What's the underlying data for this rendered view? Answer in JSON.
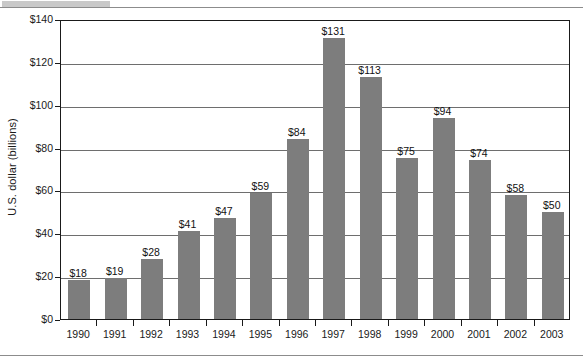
{
  "chart_data": {
    "type": "bar",
    "title": "",
    "subtitle": "",
    "xlabel": "",
    "ylabel": "U.S. dollar (billions)",
    "categories": [
      "1990",
      "1991",
      "1992",
      "1993",
      "1994",
      "1995",
      "1996",
      "1997",
      "1998",
      "1999",
      "2000",
      "2001",
      "2002",
      "2003"
    ],
    "values": [
      18,
      19,
      28,
      41,
      47,
      59,
      84,
      131,
      113,
      75,
      94,
      74,
      58,
      50
    ],
    "data_labels": [
      "$18",
      "$19",
      "$28",
      "$41",
      "$47",
      "$59",
      "$84",
      "$131",
      "$113",
      "$75",
      "$94",
      "$74",
      "$58",
      "$50"
    ],
    "ylim": [
      0,
      140
    ],
    "ytick_values": [
      0,
      20,
      40,
      60,
      80,
      100,
      120,
      140
    ],
    "ytick_labels": [
      "$0",
      "$20",
      "$40",
      "$60",
      "$80",
      "$100",
      "$120",
      "$140"
    ],
    "grid": true,
    "grid_axis": "y",
    "legend": false,
    "legend_position": "none",
    "bar_color": "#7d7d7d",
    "axis_color": "#1a1a1a",
    "gridline_color": "#6e6e6e",
    "background_color": "#ffffff"
  }
}
